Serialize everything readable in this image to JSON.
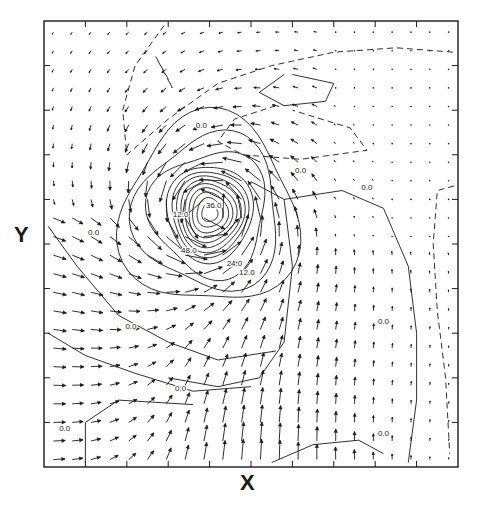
{
  "chart_data": {
    "type": "vector-field-contour",
    "title": "",
    "xlabel": "X",
    "ylabel": "Y",
    "frame": {
      "left": 44,
      "top": 21,
      "right": 458,
      "bottom": 467
    },
    "grid": false,
    "x_ticks_count": 10,
    "y_ticks_count": 10,
    "vector_grid": {
      "cols": 22,
      "rows": 24
    },
    "vortex_center": {
      "fx": 0.4,
      "fy": 0.43
    },
    "inflow_region": {
      "fx": 0.45,
      "fy": 0.85,
      "direction": "north"
    },
    "contour_labels": [
      {
        "text": "0.0",
        "fx": 0.38,
        "fy": 0.24
      },
      {
        "text": "0.0",
        "fx": 0.62,
        "fy": 0.34
      },
      {
        "text": "0.0",
        "fx": 0.12,
        "fy": 0.48
      },
      {
        "text": "12.0",
        "fx": 0.33,
        "fy": 0.44
      },
      {
        "text": "36.0",
        "fx": 0.41,
        "fy": 0.42
      },
      {
        "text": "48.0",
        "fx": 0.35,
        "fy": 0.52
      },
      {
        "text": "24.0",
        "fx": 0.46,
        "fy": 0.55
      },
      {
        "text": "12.0",
        "fx": 0.49,
        "fy": 0.57
      },
      {
        "text": "0.0",
        "fx": 0.78,
        "fy": 0.38
      },
      {
        "text": "0.0",
        "fx": 0.82,
        "fy": 0.68
      },
      {
        "text": "0.0",
        "fx": 0.82,
        "fy": 0.93
      },
      {
        "text": "0.0",
        "fx": 0.21,
        "fy": 0.69
      },
      {
        "text": "0.0",
        "fx": 0.33,
        "fy": 0.83
      },
      {
        "text": "0.0",
        "fx": 0.05,
        "fy": 0.92
      }
    ],
    "contour_levels": [
      0.0,
      12.0,
      24.0,
      36.0,
      48.0
    ],
    "dashed_contours": "negative values",
    "solid_contours": "zero and positive values"
  },
  "colors": {
    "ink": "#1a1a1a",
    "background": "#ffffff"
  }
}
